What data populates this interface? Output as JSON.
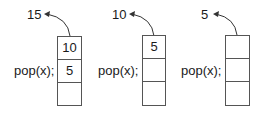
{
  "panels": [
    {
      "popped": "15",
      "label": "pop(x);",
      "cells": [
        "10",
        "5",
        ""
      ]
    },
    {
      "popped": "10",
      "label": "pop(x);",
      "cells": [
        "5",
        "",
        ""
      ]
    },
    {
      "popped": "5",
      "label": "pop(x);",
      "cells": [
        "",
        "",
        ""
      ]
    }
  ],
  "colors": {
    "stroke": "#555555",
    "text": "#1a1a1a"
  }
}
